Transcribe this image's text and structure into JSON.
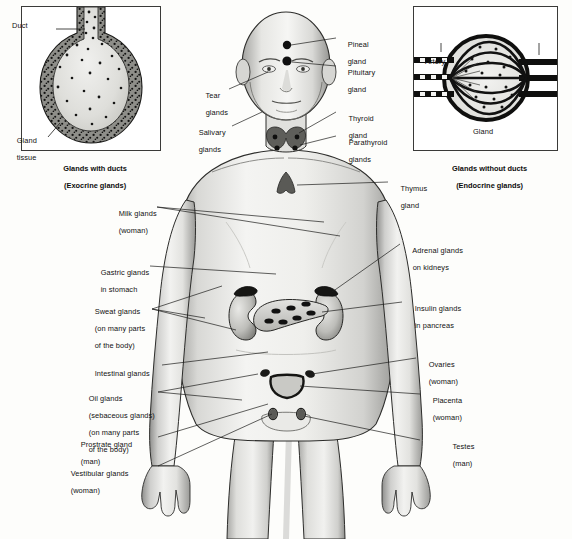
{
  "figure": {
    "background_color": "#fdfdfb",
    "ink_color": "#111111"
  },
  "insets": [
    {
      "id": "exocrine",
      "caption_line1": "Glands with ducts",
      "caption_line2": "(Exocrine glands)",
      "labels": [
        {
          "name": "duct",
          "text": "Duct"
        },
        {
          "name": "gland-tissue",
          "line1": "Gland",
          "line2": "tissue"
        }
      ]
    },
    {
      "id": "endocrine",
      "caption_line1": "Glands without ducts",
      "caption_line2": "(Endocrine glands)",
      "labels": [
        {
          "name": "artery",
          "text": "Artery"
        },
        {
          "name": "vein",
          "text": "Vein"
        },
        {
          "name": "gland",
          "text": "Gland"
        }
      ]
    }
  ],
  "body_labels": {
    "pineal": {
      "line1": "Pineal",
      "line2": "gland"
    },
    "pituitary": {
      "line1": "Pituitary",
      "line2": "gland"
    },
    "tear": {
      "line1": "Tear",
      "line2": "glands"
    },
    "salivary": {
      "line1": "Salivary",
      "line2": "glands"
    },
    "thyroid": {
      "line1": "Thyroid",
      "line2": "gland"
    },
    "parathyroid": {
      "line1": "Parathyroid",
      "line2": "glands"
    },
    "thymus": {
      "line1": "Thymus",
      "line2": "gland"
    },
    "milk": {
      "line1": "Milk glands",
      "line2": "(woman)"
    },
    "gastric": {
      "line1": "Gastric glands",
      "line2": "in stomach"
    },
    "sweat": {
      "line1": "Sweat glands",
      "line2": "(on many parts",
      "line3": "of the body)"
    },
    "intestinal": {
      "line1": "Intestinal glands"
    },
    "oil": {
      "line1": "Oil glands",
      "line2": "(sebaceous glands)",
      "line3": "(on many parts",
      "line4": "of the body)"
    },
    "prostate": {
      "line1": "Prostrate gland",
      "line2": "(man)"
    },
    "vestibular": {
      "line1": "Vestibular glands",
      "line2": "(woman)"
    },
    "adrenal": {
      "line1": "Adrenal glands",
      "line2": "on kidneys"
    },
    "insulin": {
      "line1": "Insulin glands",
      "line2": "in pancreas"
    },
    "ovaries": {
      "line1": "Ovaries",
      "line2": "(woman)"
    },
    "placenta": {
      "line1": "Placenta",
      "line2": "(woman)"
    },
    "testes": {
      "line1": "Testes",
      "line2": "(man)"
    }
  }
}
